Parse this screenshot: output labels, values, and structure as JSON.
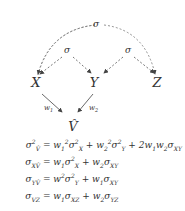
{
  "diagram": {
    "nodes": [
      {
        "id": "X",
        "label": "X",
        "x": 36,
        "y": 84
      },
      {
        "id": "Y",
        "label": "Y",
        "x": 94,
        "y": 84
      },
      {
        "id": "Z",
        "label": "Z",
        "x": 157,
        "y": 84
      },
      {
        "id": "V",
        "label": "V̂",
        "x": 73,
        "y": 128
      }
    ],
    "edges": [
      {
        "from": "X",
        "to": "V",
        "label": "w₁",
        "style": "solid"
      },
      {
        "from": "Y",
        "to": "V",
        "label": "w₂",
        "style": "solid"
      }
    ],
    "covariances": [
      {
        "between": [
          "X",
          "Z"
        ],
        "label": "σ",
        "style": "dashed",
        "shape": "arc"
      },
      {
        "between": [
          "X",
          "Y"
        ],
        "label": "σ",
        "style": "dashed"
      },
      {
        "between": [
          "Y",
          "Z"
        ],
        "label": "σ",
        "style": "dashed"
      }
    ]
  },
  "equations": [
    {
      "lhs": "σ²_V̂",
      "rhs": "= w₁²σ²_X + w₂²σ²_Y + 2w₁w₂σ_XY"
    },
    {
      "lhs": "σ_XV̂",
      "rhs": "= w₁σ²_X + w₂σ_XY"
    },
    {
      "lhs": "σ_YV̂",
      "rhs": "= w²σ²_Y + w₁σ_XY"
    },
    {
      "lhs": "σ_VZ",
      "rhs": "= w₁σ_XZ + w₂σ_YZ"
    }
  ]
}
